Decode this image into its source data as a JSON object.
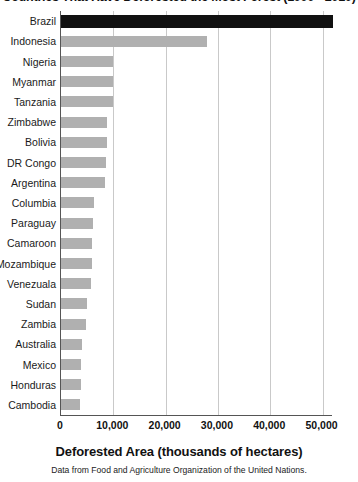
{
  "chart_data": {
    "type": "bar",
    "orientation": "horizontal",
    "title": "Countries That Have Deforested the Most Forest (1990 - 2010)",
    "xlabel": "Deforested Area (thousands of hectares)",
    "ylabel": "",
    "source_note": "Data from Food and Agriculture Organization of the United Nations.",
    "xlim": [
      0,
      52000
    ],
    "xticks": [
      0,
      10000,
      20000,
      30000,
      40000,
      50000
    ],
    "xtick_labels": [
      "0",
      "10,000",
      "20,000",
      "30,000",
      "40,000",
      "50,000"
    ],
    "grid": "vertical",
    "legend": "none",
    "highlight_category": "Brazil",
    "colors": {
      "bar": "#b0b0b0",
      "highlight_bar": "#111111",
      "gridline": "#c9c9c9",
      "axis": "#555555"
    },
    "categories": [
      "Brazil",
      "Indonesia",
      "Nigeria",
      "Myanmar",
      "Tanzania",
      "Zimbabwe",
      "Bolivia",
      "DR Congo",
      "Argentina",
      "Columbia",
      "Paraguay",
      "Camaroon",
      "Mozambique",
      "Venezuala",
      "Sudan",
      "Zambia",
      "Australia",
      "Mexico",
      "Honduras",
      "Cambodia"
    ],
    "values": [
      52000,
      28000,
      10000,
      10000,
      10000,
      8800,
      8700,
      8600,
      8400,
      6400,
      6200,
      6000,
      5900,
      5700,
      5000,
      4700,
      4000,
      3900,
      3800,
      3700
    ]
  }
}
